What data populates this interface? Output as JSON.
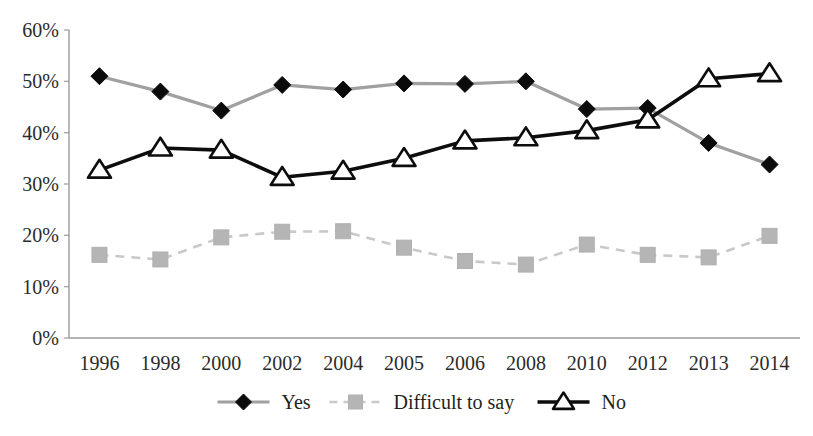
{
  "chart_data": {
    "type": "line",
    "title": "",
    "subtitle": "",
    "xlabel": "",
    "ylabel": "",
    "categories": [
      "1996",
      "1998",
      "2000",
      "2002",
      "2004",
      "2005",
      "2006",
      "2008",
      "2010",
      "2012",
      "2013",
      "2014"
    ],
    "series": [
      {
        "name": "Yes",
        "marker": "diamond",
        "color": "#a0a0a0",
        "marker_color": "#0b0b0b",
        "line_style": "solid",
        "values": [
          51.0,
          48.0,
          44.3,
          49.3,
          48.4,
          49.6,
          49.5,
          50.0,
          44.6,
          44.8,
          38.0,
          33.8
        ]
      },
      {
        "name": "Difficult to say",
        "marker": "square",
        "color": "#c9c9c9",
        "marker_color": "#b5b5b5",
        "line_style": "dashed",
        "values": [
          16.2,
          15.3,
          19.6,
          20.7,
          20.8,
          17.6,
          15.0,
          14.3,
          18.2,
          16.2,
          15.7,
          19.9
        ]
      },
      {
        "name": "No",
        "marker": "triangle",
        "color": "#0d0d0d",
        "marker_color": "#ffffff",
        "line_style": "solid",
        "values": [
          32.7,
          37.0,
          36.6,
          31.3,
          32.5,
          35.0,
          38.4,
          39.0,
          40.4,
          42.5,
          50.5,
          51.5
        ]
      }
    ],
    "ylim": [
      0,
      60
    ],
    "yticks": [
      0,
      10,
      20,
      30,
      40,
      50,
      60
    ],
    "ytick_labels": [
      "0%",
      "10%",
      "20%",
      "30%",
      "40%",
      "50%",
      "60%"
    ],
    "grid": false,
    "legend_position": "bottom"
  },
  "axes": {
    "y_tick_labels": [
      "60%",
      "50%",
      "40%",
      "30%",
      "20%",
      "10%",
      "0%"
    ],
    "x_tick_labels": [
      "1996",
      "1998",
      "2000",
      "2002",
      "2004",
      "2005",
      "2006",
      "2008",
      "2010",
      "2012",
      "2013",
      "2014"
    ]
  },
  "legend": {
    "items": [
      {
        "label": "Yes",
        "marker": "diamond-icon",
        "color": "#a0a0a0"
      },
      {
        "label": "Difficult to say",
        "marker": "square-icon",
        "color": "#c9c9c9"
      },
      {
        "label": "No",
        "marker": "triangle-icon",
        "color": "#0d0d0d"
      }
    ]
  }
}
